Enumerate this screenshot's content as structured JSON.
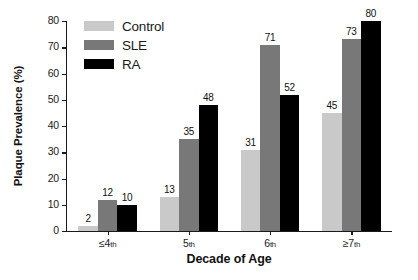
{
  "chart_data": {
    "type": "bar",
    "title": "",
    "subtitle": "",
    "xlabel": "Decade of Age",
    "ylabel": "Plaque Prevalence (%)",
    "categories": [
      "≤4th",
      "5th",
      "6th",
      "≥7th"
    ],
    "category_parts": [
      {
        "main": "≤4",
        "ord": "th"
      },
      {
        "main": "5",
        "ord": "th"
      },
      {
        "main": "6",
        "ord": "th"
      },
      {
        "main": "≥7",
        "ord": "th"
      }
    ],
    "series": [
      {
        "name": "Control",
        "color": "#c9c9c9",
        "values": [
          2,
          13,
          31,
          45
        ]
      },
      {
        "name": "SLE",
        "color": "#787878",
        "values": [
          12,
          35,
          71,
          73
        ]
      },
      {
        "name": "RA",
        "color": "#000000",
        "values": [
          10,
          48,
          52,
          80
        ]
      }
    ],
    "ylim": [
      0,
      80
    ],
    "yticks": [
      0,
      10,
      20,
      30,
      40,
      50,
      60,
      70,
      80
    ],
    "ytick_labels": [
      "0",
      "10",
      "20",
      "30",
      "40",
      "50",
      "60",
      "70",
      "80"
    ],
    "grid": false,
    "legend_position": "top-left-inside",
    "data_labels": true,
    "bar_group_gap": true
  },
  "legend": {
    "items": [
      {
        "label": "Control",
        "swatch_color": "#c9c9c9"
      },
      {
        "label": "SLE",
        "swatch_color": "#787878"
      },
      {
        "label": "RA",
        "swatch_color": "#000000"
      }
    ]
  },
  "colors": {
    "axis": "#1a1a1a",
    "text": "#111111",
    "background": "#ffffff",
    "control": "#c9c9c9",
    "sle": "#787878",
    "ra": "#000000"
  }
}
